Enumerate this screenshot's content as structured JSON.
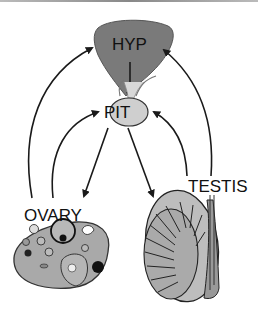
{
  "diagram": {
    "nodes": {
      "hypothalamus": {
        "label": "HYP",
        "fill": "#7a7a7a"
      },
      "pituitary": {
        "label": "PIT",
        "fill": "#cfcfcf"
      },
      "ovary": {
        "label": "OVARY",
        "fill": "#a9a9a9"
      },
      "testis": {
        "label": "TESTIS",
        "fill": "#bdbdbd"
      }
    },
    "edges": [
      {
        "from": "HYP",
        "to": "PIT",
        "direction": "down"
      },
      {
        "from": "PIT",
        "to": "OVARY"
      },
      {
        "from": "PIT",
        "to": "TESTIS"
      },
      {
        "from": "OVARY",
        "to": "HYP",
        "type": "feedback"
      },
      {
        "from": "OVARY",
        "to": "PIT",
        "type": "feedback"
      },
      {
        "from": "TESTIS",
        "to": "HYP",
        "type": "feedback"
      },
      {
        "from": "TESTIS",
        "to": "PIT",
        "type": "feedback"
      }
    ],
    "colors": {
      "arrow": "#1a1a1a",
      "outline": "#222222"
    }
  }
}
